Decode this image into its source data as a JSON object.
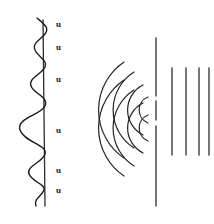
{
  "figure": {
    "background_color": "#ffffff",
    "ink_color": "#1a1a1a",
    "width": 214,
    "height": 224
  },
  "left_panel": {
    "name": "amplitude-modulated-wave",
    "axis": {
      "orientation": "vertical",
      "x": 43,
      "y_top": 20,
      "y_bottom": 206,
      "color": "#2b2b2b"
    },
    "wave": {
      "type": "sinusoid-vertical",
      "description": "amplitude modulated sine wave oscillating horizontally about the vertical axis",
      "cycles": 6,
      "max_amplitude_px": 30,
      "min_amplitude_px": 6,
      "color": "#1c1c1c"
    },
    "labels": [
      {
        "text": "u",
        "x": 56,
        "y": 20
      },
      {
        "text": "u",
        "x": 56,
        "y": 43
      },
      {
        "text": "u",
        "x": 56,
        "y": 75
      },
      {
        "text": "u",
        "x": 56,
        "y": 126
      },
      {
        "text": "u",
        "x": 56,
        "y": 166
      },
      {
        "text": "u",
        "x": 56,
        "y": 186
      }
    ]
  },
  "right_panel": {
    "name": "diffraction-through-slit",
    "barrier": {
      "x": 156,
      "y_top": 38,
      "y_bottom": 206,
      "slit_gaps": [
        {
          "y_start": 96,
          "y_end": 101
        },
        {
          "y_start": 120,
          "y_end": 126
        }
      ],
      "color": "#2b2b2b"
    },
    "circular_wavefronts": {
      "description": "two families of concentric arcs converging on the barrier slits",
      "sources": [
        {
          "cx": 152,
          "cy": 110,
          "radii": [
            14,
            28,
            45,
            58
          ]
        },
        {
          "cx": 152,
          "cy": 128,
          "radii": [
            14,
            28,
            45,
            58
          ]
        }
      ],
      "color": "#242424"
    },
    "plane_wavefronts": {
      "description": "straight vertical lines emerging to the right of the barrier",
      "lines": [
        {
          "x": 172,
          "y_top": 68,
          "y_bottom": 155
        },
        {
          "x": 186,
          "y_top": 68,
          "y_bottom": 155
        },
        {
          "x": 199,
          "y_top": 68,
          "y_bottom": 155
        },
        {
          "x": 209,
          "y_top": 68,
          "y_bottom": 155
        }
      ],
      "color": "#2b2b2b"
    }
  }
}
